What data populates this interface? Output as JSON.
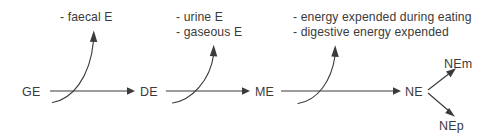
{
  "diagram": {
    "colors": {
      "stroke": "#3b3b3b",
      "text": "#3b3b3b",
      "background": "#ffffff"
    },
    "nodes": [
      {
        "id": "GE",
        "label": "GE"
      },
      {
        "id": "DE",
        "label": "DE"
      },
      {
        "id": "ME",
        "label": "ME"
      },
      {
        "id": "NE",
        "label": "NE"
      },
      {
        "id": "NEm",
        "label": "NEm"
      },
      {
        "id": "NEp",
        "label": "NEp"
      }
    ],
    "losses": [
      {
        "id": "loss-faecal",
        "after": "GE",
        "lines": [
          "- faecal E"
        ]
      },
      {
        "id": "loss-urine-gaseous",
        "after": "DE",
        "lines": [
          "- urine E",
          "- gaseous E"
        ]
      },
      {
        "id": "loss-heat-increment",
        "after": "ME",
        "lines": [
          "- energy expended during eating",
          "- digestive energy expended"
        ]
      }
    ],
    "flow_sequence": [
      "GE",
      "DE",
      "ME",
      "NE"
    ],
    "branches": [
      {
        "from": "NE",
        "to": "NEm"
      },
      {
        "from": "NE",
        "to": "NEp"
      }
    ]
  }
}
